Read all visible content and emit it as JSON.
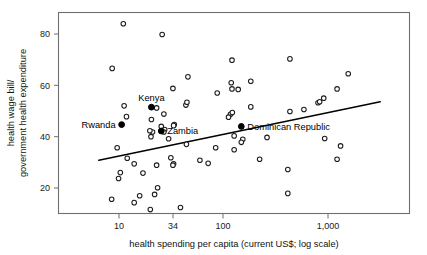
{
  "chart_data": {
    "type": "scatter",
    "title": "",
    "xlabel": "health spending per capita (current US$; log scale)",
    "ylabel": "health wage bill/ government health expenditure",
    "ylabel_lines": [
      "health wage bill/",
      "government health expenditure"
    ],
    "xscale": "log",
    "yscale": "linear",
    "xticks": [
      10,
      34,
      100,
      1000
    ],
    "xtick_labels": [
      "10",
      "34",
      "100",
      "1,000"
    ],
    "yticks": [
      20,
      40,
      60,
      80
    ],
    "ytick_labels": [
      "20",
      "40",
      "60",
      "80"
    ],
    "xlim": [
      6.0,
      3400
    ],
    "ylim": [
      10.0,
      86.0
    ],
    "grid": false,
    "legend": "none",
    "series": [
      {
        "name": "countries",
        "marker": "open-circle",
        "points": [
          [
            11.0,
            84.0
          ],
          [
            26.0,
            79.8
          ],
          [
            8.6,
            66.6
          ],
          [
            122.0,
            69.8
          ],
          [
            440.0,
            70.3
          ],
          [
            46.0,
            63.3
          ],
          [
            1600.0,
            64.5
          ],
          [
            120.0,
            61.0
          ],
          [
            185.0,
            61.6
          ],
          [
            122.0,
            58.6
          ],
          [
            140.0,
            58.4
          ],
          [
            1250.0,
            58.6
          ],
          [
            33.0,
            58.8
          ],
          [
            88.0,
            57.0
          ],
          [
            930.0,
            55.0
          ],
          [
            820.0,
            53.2
          ],
          [
            850.0,
            53.6
          ],
          [
            44.0,
            52.3
          ],
          [
            45.0,
            53.4
          ],
          [
            11.2,
            52.0
          ],
          [
            185.0,
            51.6
          ],
          [
            23.0,
            51.2
          ],
          [
            11.8,
            47.8
          ],
          [
            27.0,
            48.8
          ],
          [
            118.0,
            48.7
          ],
          [
            113.0,
            47.6
          ],
          [
            123.0,
            49.4
          ],
          [
            440.0,
            49.8
          ],
          [
            600.0,
            50.6
          ],
          [
            20.5,
            46.7
          ],
          [
            34.0,
            44.7
          ],
          [
            33.5,
            44.3
          ],
          [
            25.5,
            44.0
          ],
          [
            27.5,
            42.8
          ],
          [
            27.0,
            41.8
          ],
          [
            21.0,
            41.8
          ],
          [
            19.8,
            42.3
          ],
          [
            20.3,
            40.0
          ],
          [
            128.0,
            40.3
          ],
          [
            155.0,
            39.0
          ],
          [
            265.0,
            39.7
          ],
          [
            950.0,
            39.3
          ],
          [
            44.5,
            37.0
          ],
          [
            30.0,
            39.2
          ],
          [
            9.6,
            35.7
          ],
          [
            85.0,
            35.7
          ],
          [
            128.0,
            34.9
          ],
          [
            150.0,
            37.8
          ],
          [
            1350.0,
            36.4
          ],
          [
            12.0,
            31.6
          ],
          [
            31.5,
            31.8
          ],
          [
            33.5,
            29.4
          ],
          [
            60.0,
            30.8
          ],
          [
            72.0,
            29.6
          ],
          [
            225.0,
            31.2
          ],
          [
            1250.0,
            31.2
          ],
          [
            14.0,
            29.4
          ],
          [
            23.0,
            28.9
          ],
          [
            33.0,
            28.9
          ],
          [
            10.3,
            26.0
          ],
          [
            17.0,
            25.8
          ],
          [
            420.0,
            27.2
          ],
          [
            9.9,
            23.7
          ],
          [
            23.5,
            20.1
          ],
          [
            22.0,
            17.5
          ],
          [
            15.8,
            17.0
          ],
          [
            14.0,
            14.3
          ],
          [
            8.5,
            15.6
          ],
          [
            420.0,
            17.9
          ],
          [
            20.0,
            11.6
          ],
          [
            39.0,
            12.4
          ]
        ]
      },
      {
        "name": "highlighted-countries",
        "marker": "solid-circle",
        "points": [
          {
            "label": "Kenya",
            "x": 20.5,
            "y": 51.5,
            "label_pos": "above"
          },
          {
            "label": "Rwanda",
            "x": 10.6,
            "y": 44.7,
            "label_pos": "left"
          },
          {
            "label": "Zambia",
            "x": 25.5,
            "y": 42.2,
            "label_pos": "right"
          },
          {
            "label": "Dominican Republic",
            "x": 150.0,
            "y": 44.0,
            "label_pos": "right"
          }
        ]
      }
    ],
    "trendline": {
      "type": "line",
      "points": [
        [
          6.4,
          30.8
        ],
        [
          3250.0,
          53.6
        ]
      ],
      "color": "#000000"
    }
  }
}
